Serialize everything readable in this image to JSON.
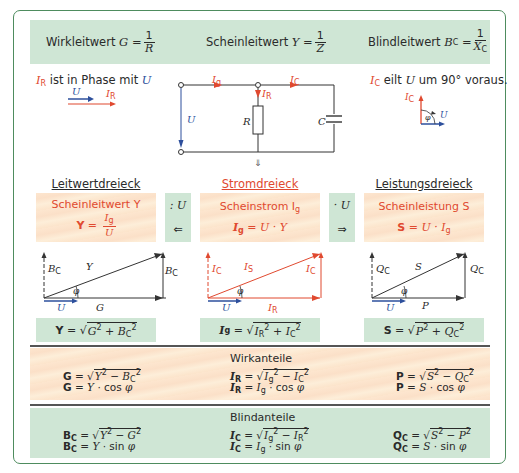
{
  "header": {
    "wirkleitwert": {
      "label": "Wirkleitwert",
      "symbol": "G",
      "eq": "=",
      "num": "1",
      "den": "R"
    },
    "scheinleitwert": {
      "label": "Scheinleitwert",
      "symbol": "Y",
      "eq": "=",
      "num": "1",
      "den": "Z"
    },
    "blindleitwert": {
      "label": "Blindleitwert",
      "symbol": "B",
      "symbol_sub": "C",
      "eq": "=",
      "num": "1",
      "den": "X",
      "den_sub": "C"
    }
  },
  "left_note": {
    "symbol": "I",
    "symbol_sub": "R",
    "text": " ist in Phase mit ",
    "ref": "U",
    "phasor_u": "U",
    "phasor_i": "I",
    "phasor_i_sub": "R"
  },
  "right_note": {
    "symbol": "I",
    "symbol_sub": "C",
    "text1": " eilt ",
    "ref": "U",
    "text2": " um 90° voraus.",
    "phasor_ic": "I",
    "phasor_ic_sub": "C",
    "phasor_phi": "φ",
    "phasor_u": "U"
  },
  "circuit": {
    "labels": {
      "Ig": "I",
      "Ig_sub": "g",
      "IC": "I",
      "IC_sub": "C",
      "IR": "I",
      "IR_sub": "R",
      "U": "U",
      "R": "R",
      "C": "C"
    },
    "down_arrow": "⇓"
  },
  "columns": {
    "leitwert": {
      "title": "Leitwertdreieck",
      "box_title": "Scheinleitwert Y",
      "formula_lhs": "Y",
      "formula_num": "I",
      "formula_num_sub": "g",
      "formula_den": "U"
    },
    "strom": {
      "title": "Stromdreieck",
      "box_title": "Scheinstrom I",
      "box_title_sub": "g",
      "formula": "= U · Y"
    },
    "leistung": {
      "title": "Leistungsdreieck",
      "box_title": "Scheinleistung S",
      "formula": "= U · I",
      "formula_sub": "g"
    }
  },
  "operators": {
    "left": {
      "top": ": U",
      "bottom": "⇐"
    },
    "right": {
      "top": "· U",
      "bottom": "⇒"
    }
  },
  "triangles": {
    "leitwert": {
      "vertical_left": "B",
      "vertical_left_sub": "C",
      "hyp": "Y",
      "vertical_right": "B",
      "vertical_right_sub": "C",
      "angle": "φ",
      "ref": "U",
      "base": "G"
    },
    "strom": {
      "vertical_left": "I",
      "vertical_left_sub": "C",
      "hyp": "I",
      "hyp_sub": "S",
      "vertical_right": "I",
      "vertical_right_sub": "C",
      "angle": "φ",
      "ref": "U",
      "base": "I",
      "base_sub": "R"
    },
    "leistung": {
      "vertical_left": "Q",
      "vertical_left_sub": "C",
      "hyp": "S",
      "vertical_right": "Q",
      "vertical_right_sub": "C",
      "angle": "φ",
      "ref": "U",
      "base": "P"
    }
  },
  "magnitude_formulas": {
    "leitwert": "Y = √(G² + B_C²)",
    "strom": "I_g = √(I_R² + I_C²)",
    "leistung": "S = √(P² + Q_C²)"
  },
  "wirkanteile": {
    "title": "Wirkanteile",
    "col1": [
      "G = √(Y² − B_C²)",
      "G = Y · cos φ"
    ],
    "col2": [
      "I_R = √(I_g² − I_C²)",
      "I_R = I_g · cos φ"
    ],
    "col3": [
      "P = √(S² − Q_C²)",
      "P = S · cos φ"
    ]
  },
  "blindanteile": {
    "title": "Blindanteile",
    "col1": [
      "B_C = √(Y² − G²)",
      "B_C = Y · sin φ"
    ],
    "col2": [
      "I_C = √(I_g² − I_R²)",
      "I_C = I_g · sin φ"
    ],
    "col3": [
      "Q_C = √(S² − P²)",
      "Q_C = S · sin φ"
    ]
  },
  "colors": {
    "accent_green": "#4e8c5e",
    "green_band": "#cfe6d5",
    "peach_band": "#fce4cb",
    "red": "#e0492f",
    "blue": "#2d4f9c"
  }
}
